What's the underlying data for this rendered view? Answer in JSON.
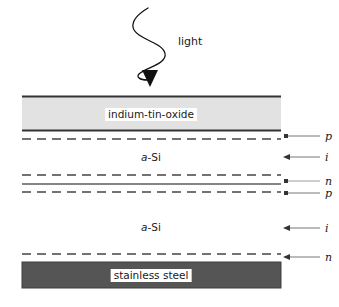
{
  "figure": {
    "width": 339,
    "height": 307,
    "background": "#ffffff"
  },
  "light": {
    "label": "light",
    "wave_icon": "sine-wave-icon",
    "arrow_icon": "down-arrowhead-icon",
    "color": "#111111"
  },
  "layers": [
    {
      "id": "ito",
      "caption": "indium-tin-oxide",
      "fill": "#e2e2e2",
      "stroke": "#333333",
      "top": 96,
      "bottom": 131,
      "kind": "filled-band"
    },
    {
      "id": "a-si-top",
      "caption": "a-Si",
      "caption_italic_prefix": "a",
      "caption_rest": "-Si",
      "fill": "#ffffff",
      "kind": "open-layer"
    },
    {
      "id": "a-si-bottom",
      "caption": "a-Si",
      "caption_italic_prefix": "a",
      "caption_rest": "-Si",
      "fill": "#ffffff",
      "kind": "open-layer"
    },
    {
      "id": "stainless-steel",
      "caption": "stainless steel",
      "fill": "#555555",
      "stroke": "#3a3a3a",
      "top": 262,
      "bottom": 288,
      "kind": "filled-band"
    }
  ],
  "interfaces": [
    {
      "y": 96,
      "style": "solid",
      "color": "#333333",
      "width": 1.6
    },
    {
      "y": 131,
      "style": "solid",
      "color": "#333333",
      "width": 1.6
    },
    {
      "y": 139,
      "style": "dashed",
      "color": "#444444",
      "width": 1.6
    },
    {
      "y": 175,
      "style": "dashed",
      "color": "#444444",
      "width": 1.6
    },
    {
      "y": 184,
      "style": "solid",
      "color": "#666666",
      "width": 1.6
    },
    {
      "y": 192,
      "style": "dashed",
      "color": "#444444",
      "width": 1.6
    },
    {
      "y": 254,
      "style": "dashed",
      "color": "#444444",
      "width": 1.6
    }
  ],
  "doping_labels": [
    {
      "label": "p",
      "y": 136,
      "arrow_y": 136,
      "has_dot": true
    },
    {
      "label": "i",
      "y": 157,
      "arrow_y": 157,
      "has_dot": false
    },
    {
      "label": "n",
      "y": 181,
      "arrow_y": 181,
      "has_dot": true
    },
    {
      "label": "p",
      "y": 193,
      "arrow_y": 193,
      "has_dot": true
    },
    {
      "label": "i",
      "y": 228,
      "arrow_y": 228,
      "has_dot": false
    },
    {
      "label": "n",
      "y": 257,
      "arrow_y": 257,
      "has_dot": true
    }
  ],
  "geometry": {
    "band_left": 22,
    "band_right": 281,
    "arrow_tail_x": 320,
    "arrow_head_x": 285
  }
}
